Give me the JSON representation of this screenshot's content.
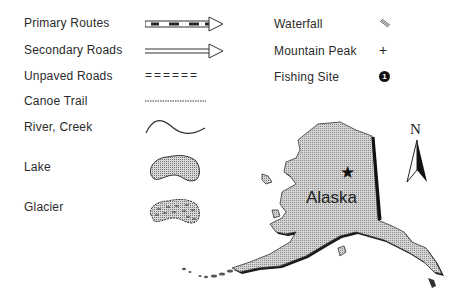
{
  "legend": {
    "left": [
      {
        "label": "Primary Routes",
        "symbol": "primary-route-line"
      },
      {
        "label": "Secondary Roads",
        "symbol": "secondary-road-line"
      },
      {
        "label": "Unpaved Roads",
        "symbol": "unpaved-road-line",
        "glyph": "======"
      },
      {
        "label": "Canoe Trail",
        "symbol": "canoe-trail-line"
      },
      {
        "label": "River, Creek",
        "symbol": "river-line"
      },
      {
        "label": "Lake",
        "symbol": "lake-shape"
      },
      {
        "label": "Glacier",
        "symbol": "glacier-shape"
      }
    ],
    "right": [
      {
        "label": "Waterfall",
        "symbol": "waterfall-icon"
      },
      {
        "label": "Mountain Peak",
        "symbol": "mountain-peak-icon",
        "glyph": "+"
      },
      {
        "label": "Fishing Site",
        "symbol": "fishing-site-icon",
        "glyph": "1"
      }
    ]
  },
  "map": {
    "state_label": "Alaska",
    "capital_marker": "star-icon",
    "north_label": "N",
    "fill_color": "#c8c8c8",
    "shadow_color": "#1a1a1a"
  }
}
